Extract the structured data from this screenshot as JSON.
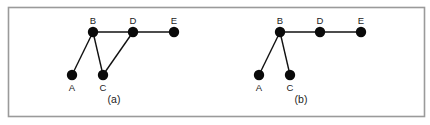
{
  "figure": {
    "colors": {
      "node": "#0a0a0a",
      "edge": "#111111",
      "frame": "#9a9a9a",
      "text": "#222222"
    }
  },
  "graphs": [
    {
      "id": "a",
      "caption": "(a)",
      "nodes": [
        {
          "id": "A",
          "label": "A"
        },
        {
          "id": "B",
          "label": "B"
        },
        {
          "id": "C",
          "label": "C"
        },
        {
          "id": "D",
          "label": "D"
        },
        {
          "id": "E",
          "label": "E"
        }
      ],
      "edges": [
        [
          "B",
          "A"
        ],
        [
          "B",
          "C"
        ],
        [
          "B",
          "D"
        ],
        [
          "D",
          "C"
        ],
        [
          "D",
          "E"
        ]
      ]
    },
    {
      "id": "b",
      "caption": "(b)",
      "nodes": [
        {
          "id": "A",
          "label": "A"
        },
        {
          "id": "B",
          "label": "B"
        },
        {
          "id": "C",
          "label": "C"
        },
        {
          "id": "D",
          "label": "D"
        },
        {
          "id": "E",
          "label": "E"
        }
      ],
      "edges": [
        [
          "B",
          "A"
        ],
        [
          "B",
          "C"
        ],
        [
          "B",
          "D"
        ],
        [
          "D",
          "E"
        ]
      ]
    }
  ]
}
